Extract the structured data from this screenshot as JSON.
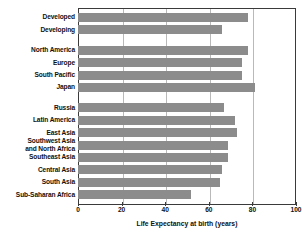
{
  "chart_data": {
    "type": "bar",
    "orientation": "horizontal",
    "title": "",
    "xlabel": "Life Expectancy at birth (years)",
    "ylabel": "",
    "xlim": [
      0,
      100
    ],
    "xticks": [
      0,
      20,
      40,
      60,
      80,
      100
    ],
    "grid": true,
    "legend": "none",
    "bar_color": "#8c8c8c",
    "categories": [
      "Developed",
      "Developing",
      "North America",
      "Europe",
      "South Pacific",
      "Japan",
      "Russia",
      "Latin America",
      "East Asia",
      "Southwest Asia\nand North Africa",
      "Southeast Asia",
      "Central Asia",
      "South Asia",
      "Sub-Saharan Africa"
    ],
    "values": [
      78,
      66,
      78,
      75,
      75,
      81,
      67,
      72,
      73,
      69,
      69,
      66,
      65,
      52
    ],
    "groups": [
      {
        "name": "overview",
        "categories": [
          "Developed",
          "Developing"
        ]
      },
      {
        "name": "developed-regions",
        "categories": [
          "North America",
          "Europe",
          "South Pacific",
          "Japan"
        ]
      },
      {
        "name": "developing-regions",
        "categories": [
          "Russia",
          "Latin America",
          "East Asia",
          "Southwest Asia and North Africa",
          "Southeast Asia",
          "Central Asia",
          "South Asia",
          "Sub-Saharan Africa"
        ]
      }
    ]
  }
}
